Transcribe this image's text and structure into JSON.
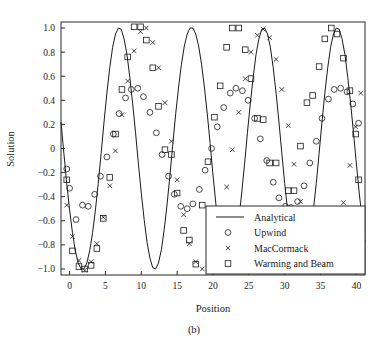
{
  "chart_data": {
    "type": "line",
    "title": "",
    "xlabel": "Position",
    "ylabel": "Solution",
    "caption": "(b)",
    "xlim": [
      -1.2,
      41.2
    ],
    "ylim": [
      -1.05,
      1.05
    ],
    "xticks": [
      0,
      5,
      10,
      15,
      20,
      25,
      30,
      35,
      40
    ],
    "xtick_labels": [
      "0",
      "5",
      "10",
      "15",
      "20",
      "25",
      "30",
      "35",
      "40"
    ],
    "yticks": [
      -1.0,
      -0.8,
      -0.6,
      -0.4,
      -0.2,
      0,
      0.2,
      0.4,
      0.6,
      0.8,
      1.0
    ],
    "ytick_labels": [
      "-1.0",
      "-0.8",
      "-0.6",
      "-0.4",
      "-0.2",
      "0",
      "0.2",
      "0.4",
      "0.6",
      "0.8",
      "1.0"
    ],
    "grid": false,
    "legend_position": "lower-right",
    "wave": {
      "amplitude": 1.0,
      "period": 13.35,
      "phase_x_first_trough": 2.05
    },
    "series": [
      {
        "name": "Analytical",
        "marker": "line",
        "color": "#1a1a1a",
        "x": [
          -1.2,
          -0.8,
          -0.4,
          0,
          0.4,
          0.8,
          1.2,
          1.6,
          2,
          2.4,
          2.8,
          3.2,
          3.6,
          4,
          4.4,
          4.8,
          5.2,
          5.6,
          6,
          6.4,
          6.8,
          7.2,
          7.6,
          8,
          8.4,
          8.8,
          9.2,
          9.6,
          10,
          10.4,
          10.8,
          11.2,
          11.6,
          12,
          12.4,
          12.8,
          13.2,
          13.6,
          14,
          14.4,
          14.8,
          15.2,
          15.6,
          16,
          16.4,
          16.8,
          17.2,
          17.6,
          18,
          18.4,
          18.8,
          19.2,
          19.6,
          20,
          20.4,
          20.8,
          21.2,
          21.6,
          22,
          22.4,
          22.8,
          23.2,
          23.6,
          24,
          24.4,
          24.8,
          25.2,
          25.6,
          26,
          26.4,
          26.8,
          27.2,
          27.6,
          28,
          28.4,
          28.8,
          29.2,
          29.6,
          30,
          30.4,
          30.8,
          31.2,
          31.6,
          32,
          32.4,
          32.8,
          33.2,
          33.6,
          34,
          34.4,
          34.8,
          35.2,
          35.6,
          36,
          36.4,
          36.8,
          37.2,
          37.6,
          38,
          38.4,
          38.8,
          39.2,
          39.6,
          40,
          40.4,
          40.8,
          41.2
        ],
        "y": [
          0.22,
          -0.04,
          -0.29,
          -0.51,
          -0.7,
          -0.85,
          -0.95,
          -1.0,
          -1.0,
          -0.95,
          -0.85,
          -0.7,
          -0.51,
          -0.29,
          -0.04,
          0.22,
          0.46,
          0.67,
          0.84,
          0.95,
          1.0,
          0.99,
          0.91,
          0.78,
          0.59,
          0.37,
          0.13,
          -0.13,
          -0.37,
          -0.59,
          -0.78,
          -0.91,
          -0.99,
          -1.0,
          -0.95,
          -0.84,
          -0.67,
          -0.46,
          -0.22,
          0.04,
          0.29,
          0.51,
          0.7,
          0.85,
          0.95,
          1.0,
          1.0,
          0.95,
          0.85,
          0.7,
          0.51,
          0.29,
          0.04,
          -0.22,
          -0.46,
          -0.67,
          -0.84,
          -0.95,
          -1.0,
          -0.99,
          -0.91,
          -0.78,
          -0.59,
          -0.37,
          -0.13,
          0.13,
          0.37,
          0.59,
          0.78,
          0.91,
          0.99,
          1.0,
          0.95,
          0.84,
          0.67,
          0.46,
          0.22,
          -0.04,
          -0.29,
          -0.51,
          -0.7,
          -0.85,
          -0.95,
          -1.0,
          -1.0,
          -0.95,
          -0.85,
          -0.7,
          -0.51,
          -0.29,
          -0.04,
          0.22,
          0.46,
          0.67,
          0.84,
          0.95,
          1.0,
          0.99,
          0.91,
          0.78,
          0.59,
          0.37,
          0.13,
          -0.13,
          -0.37,
          -0.59,
          -0.78
        ]
      },
      {
        "name": "Upwind",
        "marker": "circle",
        "color": "#1a1a1a",
        "x": [
          -0.4,
          0,
          0.9,
          1.8,
          2.6,
          3.5,
          4.3,
          5.2,
          6.1,
          6.9,
          7.8,
          8.6,
          9.5,
          10.3,
          11.2,
          12.1,
          12.9,
          13.8,
          14.6,
          15.5,
          16.4,
          17.2,
          18.1,
          18.9,
          19.8,
          20.6,
          21.5,
          22.4,
          23.2,
          24.1,
          24.9,
          25.8,
          26.6,
          27.5,
          28.4,
          29.2,
          30.1,
          30.9,
          31.8,
          32.7,
          33.5,
          34.4,
          35.2,
          36.1,
          36.9,
          37.8,
          38.7,
          39.5,
          40.3
        ],
        "y": [
          -0.17,
          -0.33,
          -0.59,
          -0.47,
          -0.48,
          -0.38,
          -0.23,
          -0.07,
          0.12,
          0.29,
          0.42,
          0.49,
          0.5,
          0.43,
          0.3,
          0.13,
          -0.05,
          -0.23,
          -0.38,
          -0.48,
          -0.5,
          -0.46,
          -0.34,
          -0.18,
          0.0,
          0.18,
          0.34,
          0.46,
          0.5,
          0.48,
          0.4,
          0.25,
          0.08,
          -0.1,
          -0.28,
          -0.41,
          -0.48,
          -0.49,
          -0.44,
          -0.31,
          -0.12,
          0.06,
          0.25,
          0.41,
          0.49,
          0.5,
          0.47,
          0.37,
          0.21
        ]
      },
      {
        "name": "MacCormack",
        "marker": "cross",
        "color": "#1a1a1a",
        "x": [
          -0.4,
          0.4,
          1.3,
          2.1,
          3.0,
          3.8,
          4.7,
          5.6,
          6.4,
          7.3,
          8.1,
          9.0,
          9.9,
          10.7,
          11.6,
          12.4,
          13.3,
          14.2,
          15.0,
          15.9,
          16.7,
          17.6,
          18.5,
          19.3,
          20.2,
          21.0,
          21.9,
          22.7,
          23.6,
          24.5,
          25.3,
          26.2,
          27.0,
          27.9,
          28.8,
          29.6,
          30.5,
          31.3,
          32.2,
          33.1,
          33.9,
          34.8,
          35.6,
          36.5,
          37.3,
          38.2,
          39.1,
          39.9,
          40.6
        ],
        "y": [
          -0.47,
          -0.73,
          -0.93,
          -1.01,
          -0.94,
          -0.79,
          -0.57,
          -0.31,
          -0.02,
          0.28,
          0.56,
          0.81,
          0.97,
          1.0,
          0.88,
          0.67,
          0.38,
          0.06,
          -0.26,
          -0.55,
          -0.79,
          -0.94,
          -1.0,
          -0.96,
          -0.82,
          -0.6,
          -0.32,
          -0.01,
          0.3,
          0.58,
          0.8,
          0.94,
          0.99,
          0.92,
          0.74,
          0.49,
          0.19,
          -0.13,
          -0.44,
          -0.7,
          -0.89,
          -0.99,
          -0.99,
          -0.9,
          -0.71,
          -0.45,
          -0.14,
          0.18,
          0.46
        ]
      },
      {
        "name": "Warming and Beam",
        "marker": "square",
        "color": "#1a1a1a",
        "x": [
          -0.4,
          0.4,
          1.3,
          2.1,
          3.0,
          3.8,
          4.7,
          5.6,
          6.4,
          7.3,
          8.1,
          9.0,
          9.9,
          10.7,
          11.6,
          12.4,
          13.3,
          14.2,
          15.0,
          15.9,
          16.7,
          17.6,
          18.5,
          19.3,
          20.2,
          21.0,
          21.9,
          22.7,
          23.6,
          24.5,
          25.3,
          26.2,
          27.0,
          27.9,
          28.8,
          29.6,
          30.5,
          31.3,
          32.2,
          33.1,
          33.9,
          34.8,
          35.6,
          36.5,
          37.3,
          38.2,
          39.1,
          39.9,
          40.3
        ],
        "y": [
          -0.26,
          -0.85,
          -0.98,
          -1.0,
          -0.97,
          -0.83,
          -0.58,
          -0.24,
          0.12,
          0.49,
          0.76,
          1.01,
          1.01,
          0.9,
          0.67,
          0.35,
          -0.01,
          -0.05,
          -0.37,
          -0.68,
          -0.76,
          -0.96,
          -0.47,
          -0.11,
          0.26,
          0.52,
          0.84,
          1.0,
          1.0,
          0.82,
          0.58,
          0.25,
          0.24,
          -0.12,
          -0.12,
          -0.98,
          -0.35,
          -0.35,
          0.02,
          0.38,
          0.44,
          0.68,
          0.91,
          1.0,
          0.95,
          0.75,
          0.48,
          0.12,
          -0.26
        ]
      }
    ],
    "legend": [
      {
        "label": "Analytical",
        "marker": "line"
      },
      {
        "label": "Upwind",
        "marker": "circle"
      },
      {
        "label": "MacCormack",
        "marker": "cross"
      },
      {
        "label": "Warming and Beam",
        "marker": "square"
      }
    ]
  }
}
